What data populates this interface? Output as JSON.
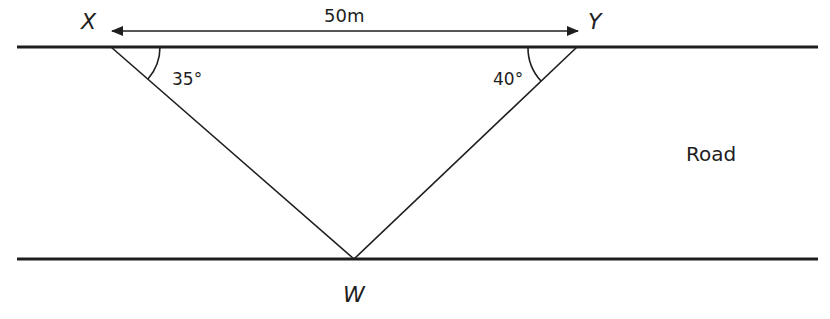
{
  "diagram": {
    "type": "geometry",
    "points": {
      "X": {
        "label": "X",
        "x": 111,
        "y": 47
      },
      "Y": {
        "label": "Y",
        "x": 577,
        "y": 47
      },
      "W": {
        "label": "W",
        "x": 354,
        "y": 259
      }
    },
    "distance_label": "50m",
    "angles": {
      "X": "35°",
      "Y": "40°"
    },
    "region_label": "Road",
    "colors": {
      "line": "#1e1e1e",
      "background": "#ffffff"
    }
  }
}
